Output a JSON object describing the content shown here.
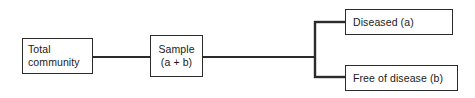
{
  "diagram": {
    "background_color": "#ffffff",
    "stroke_color": "#2b2b2b",
    "text_color": "#1a1a1a",
    "nodes": [
      {
        "id": "total-community",
        "lines": [
          "Total",
          "community"
        ],
        "line1": "Total",
        "line2": "community"
      },
      {
        "id": "sample",
        "lines": [
          "Sample",
          "(a + b)"
        ],
        "line1": "Sample",
        "line2": "(a + b)"
      },
      {
        "id": "diseased",
        "lines": [
          "Diseased (a)"
        ],
        "line1": "Diseased (a)"
      },
      {
        "id": "free-of-disease",
        "lines": [
          "Free of disease (b)"
        ],
        "line1": "Free of disease (b)"
      }
    ],
    "edges": [
      {
        "id": "total-community-to-sample",
        "from": "total-community",
        "to": "sample"
      },
      {
        "id": "sample-to-split",
        "from": "sample",
        "to": "split-point"
      },
      {
        "id": "split-to-diseased",
        "from": "split-point",
        "to": "diseased"
      },
      {
        "id": "split-to-free-of-disease",
        "from": "split-point",
        "to": "free-of-disease"
      }
    ]
  }
}
